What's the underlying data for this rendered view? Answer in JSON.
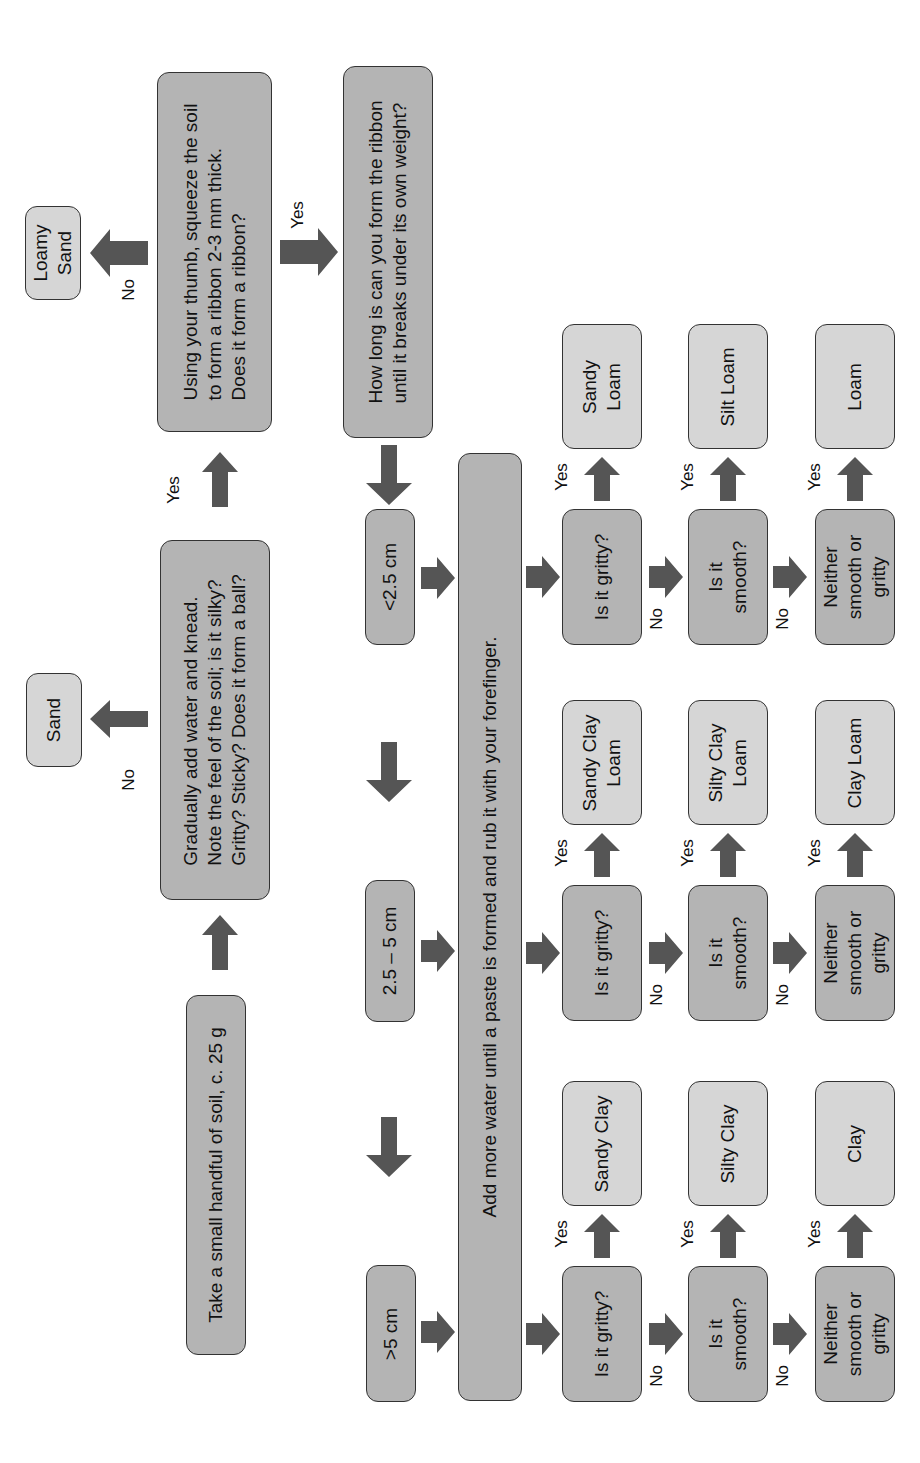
{
  "colors": {
    "question_fill": "#b4b4b4",
    "result_fill": "#d6d6d6",
    "arrow": "#555555",
    "border": "#333333"
  },
  "steps": {
    "start": "Take a small handful of soil, c. 25 g",
    "knead": "Gradually add water and knead.\nNote the feel of the soil; is it silky?\nGritty? Sticky? Does it form a ball?",
    "ribbon": "Using your thumb, squeeze the soil\nto form a ribbon 2-3 mm thick.\nDoes it form a ribbon?",
    "length": "How long is can you form the ribbon\nuntil it breaks under its own weight?",
    "paste": "Add more water until a paste is formed and rub it with your forefinger."
  },
  "results_top": {
    "sand": "Sand",
    "loamy_sand": "Loamy\nSand"
  },
  "ranges": [
    "<2.5 cm",
    "2.5 – 5 cm",
    ">5 cm"
  ],
  "labels": {
    "yes": "Yes",
    "no": "No"
  },
  "questions": {
    "gritty": "Is it gritty?",
    "smooth": "Is it\nsmooth?",
    "neither": "Neither\nsmooth or\ngritty"
  },
  "columns": [
    {
      "range": "<2.5 cm",
      "gritty_result": "Sandy\nLoam",
      "smooth_result": "Silt Loam",
      "neither_result": "Loam"
    },
    {
      "range": "2.5 – 5 cm",
      "gritty_result": "Sandy Clay\nLoam",
      "smooth_result": "Silty Clay\nLoam",
      "neither_result": "Clay Loam"
    },
    {
      "range": ">5 cm",
      "gritty_result": "Sandy Clay",
      "smooth_result": "Silty Clay",
      "neither_result": "Clay"
    }
  ]
}
